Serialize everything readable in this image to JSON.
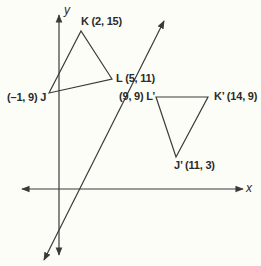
{
  "diagram": {
    "type": "coordinate-plane-reflection",
    "axes": {
      "x_label": "x",
      "y_label": "y"
    },
    "reflection_line": {
      "description": "line through L (5, 11) and L' (9, 9)"
    },
    "original_triangle": {
      "vertices": [
        {
          "name": "K",
          "label": "K (2, 15)",
          "x": 2,
          "y": 15
        },
        {
          "name": "L",
          "label": "L (5, 11)",
          "x": 5,
          "y": 11
        },
        {
          "name": "J",
          "label": "(–1, 9) J",
          "x": -1,
          "y": 9
        }
      ]
    },
    "image_triangle": {
      "vertices": [
        {
          "name": "L'",
          "label": "(9, 9) L’",
          "x": 9,
          "y": 9
        },
        {
          "name": "K'",
          "label": "K’ (14, 9)",
          "x": 14,
          "y": 9
        },
        {
          "name": "J'",
          "label": "J’ (11, 3)",
          "x": 11,
          "y": 3
        }
      ]
    },
    "colors": {
      "line": "#3a3a3a",
      "background": "#fdfdf8",
      "text": "#2b2b2b"
    }
  }
}
